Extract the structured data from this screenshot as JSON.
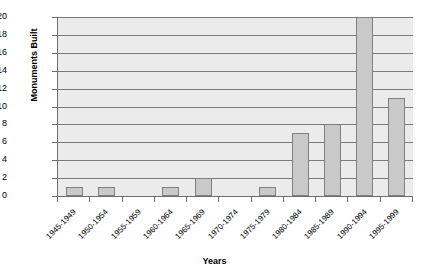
{
  "chart_data": {
    "type": "bar",
    "title": "",
    "xlabel": "Years",
    "ylabel": "Monuments Built",
    "categories": [
      "1945-1949",
      "1950-1954",
      "1955-1959",
      "1960-1964",
      "1965-1969",
      "1970-1974",
      "1975-1979",
      "1980-1984",
      "1985-1989",
      "1990-1994",
      "1995-1999"
    ],
    "values": [
      1,
      1,
      0,
      1,
      2,
      0,
      1,
      7,
      8,
      20,
      11
    ],
    "ylim": [
      0,
      20
    ],
    "ytick_labels": [
      "0",
      "2",
      "4",
      "6",
      "8",
      "10",
      "12",
      "14",
      "16",
      "18",
      "20"
    ],
    "ytick_values": [
      0,
      2,
      4,
      6,
      8,
      10,
      12,
      14,
      16,
      18,
      20
    ],
    "grid": "horizontal",
    "legend": "none",
    "bar_fill_color": "#c9c9c9",
    "bar_border_color": "#808080",
    "plot_background_color": "#ebebeb",
    "gridline_color": "#7a7a7a",
    "axis_color": "#6e6e6e",
    "figure_background_color": "#ffffff"
  }
}
